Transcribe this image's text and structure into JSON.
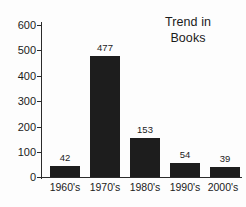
{
  "chart_data": {
    "type": "bar",
    "title": "Trend in Books",
    "title_lines": [
      "Trend in",
      "Books"
    ],
    "categories": [
      "1960's",
      "1970's",
      "1980's",
      "1990's",
      "2000's"
    ],
    "values": [
      42,
      477,
      153,
      54,
      39
    ],
    "value_labels": [
      "42",
      "477",
      "153",
      "54",
      "39"
    ],
    "xlabel": "",
    "ylabel": "",
    "ylim": [
      0,
      600
    ],
    "yticks": [
      0,
      100,
      200,
      300,
      400,
      500,
      600
    ],
    "ytick_labels": [
      "0",
      "100",
      "200",
      "300",
      "400",
      "500",
      "600"
    ],
    "grid": false,
    "legend": false,
    "bar_color": "#1d1d1d",
    "axis_color": "#2b2b2b",
    "background_color": "#fdfdfd",
    "text_color": "#1b1b1b"
  }
}
